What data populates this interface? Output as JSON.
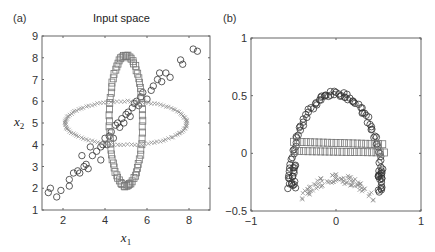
{
  "panels": {
    "a": {
      "label": "(a)",
      "title": "Input space"
    },
    "b": {
      "label": "(b)",
      "title": ""
    }
  },
  "chart_data": [
    {
      "type": "scatter",
      "panel": "(a)",
      "title": "Input space",
      "xlabel": "x1",
      "ylabel": "x2",
      "xlim": [
        1,
        9
      ],
      "ylim": [
        1,
        9
      ],
      "xticks": [
        2,
        4,
        6,
        8
      ],
      "yticks": [
        1,
        2,
        3,
        4,
        5,
        6,
        7,
        8,
        9
      ],
      "grid": false,
      "series": [
        {
          "name": "circles (diagonal line)",
          "marker": "o",
          "shape": "line",
          "description": "points scattered along line x2 ≈ x1 from (1.3,1.8) to (8.4,8.4)",
          "points": [
            [
              1.3,
              1.8
            ],
            [
              1.4,
              2.0
            ],
            [
              1.7,
              1.6
            ],
            [
              1.9,
              1.9
            ],
            [
              2.3,
              2.1
            ],
            [
              2.3,
              2.4
            ],
            [
              2.5,
              2.7
            ],
            [
              2.7,
              2.8
            ],
            [
              2.8,
              2.7
            ],
            [
              2.9,
              3.5
            ],
            [
              3.0,
              3.0
            ],
            [
              3.1,
              3.1
            ],
            [
              3.2,
              2.9
            ],
            [
              3.3,
              3.9
            ],
            [
              3.4,
              3.5
            ],
            [
              3.6,
              3.7
            ],
            [
              3.8,
              3.3
            ],
            [
              3.8,
              3.9
            ],
            [
              3.9,
              4.0
            ],
            [
              4.0,
              4.3
            ],
            [
              4.1,
              4.0
            ],
            [
              4.2,
              4.4
            ],
            [
              4.3,
              4.6
            ],
            [
              4.4,
              4.3
            ],
            [
              4.5,
              4.9
            ],
            [
              4.6,
              5.0
            ],
            [
              4.7,
              4.8
            ],
            [
              4.8,
              5.2
            ],
            [
              4.9,
              5.0
            ],
            [
              5.0,
              5.4
            ],
            [
              5.1,
              5.5
            ],
            [
              5.2,
              5.3
            ],
            [
              5.3,
              5.7
            ],
            [
              5.4,
              5.9
            ],
            [
              5.5,
              6.0
            ],
            [
              5.6,
              5.8
            ],
            [
              5.7,
              6.2
            ],
            [
              5.8,
              6.4
            ],
            [
              6.0,
              6.1
            ],
            [
              6.2,
              6.5
            ],
            [
              6.3,
              6.7
            ],
            [
              6.5,
              7.0
            ],
            [
              6.6,
              7.3
            ],
            [
              6.7,
              6.9
            ],
            [
              6.9,
              7.3
            ],
            [
              7.1,
              7.1
            ],
            [
              7.6,
              7.9
            ],
            [
              7.7,
              7.7
            ],
            [
              8.2,
              8.4
            ],
            [
              8.4,
              8.3
            ]
          ]
        },
        {
          "name": "squares (vertical ellipse)",
          "marker": "s",
          "shape": "ellipse",
          "center": [
            5.0,
            5.1
          ],
          "radii": [
            0.8,
            3.0
          ]
        },
        {
          "name": "crosses (horizontal ellipse)",
          "marker": "x",
          "shape": "ellipse",
          "center": [
            5.0,
            5.0
          ],
          "radii": [
            2.9,
            1.0
          ]
        }
      ]
    },
    {
      "type": "scatter",
      "panel": "(b)",
      "title": "",
      "xlabel": "",
      "ylabel": "",
      "xlim": [
        -1,
        1
      ],
      "ylim": [
        -0.5,
        1
      ],
      "xticks": [
        -1,
        0,
        1
      ],
      "yticks": [
        -0.5,
        0,
        0.5,
        1
      ],
      "grid": false,
      "series": [
        {
          "name": "circles (arch)",
          "marker": "o",
          "shape": "arch",
          "description": "upside-down U from (-0.55,-0.35) up to (0,0.52) down to (0.55,-0.35)"
        },
        {
          "name": "squares (band)",
          "marker": "s",
          "shape": "band",
          "description": "two rows of squares from x=-0.5 to 0.55, y≈0.1 and y≈0.0, slight downward slope"
        },
        {
          "name": "crosses (arc)",
          "marker": "x",
          "shape": "arc",
          "description": "inverted-U arc from (-0.4,-0.42) peak (0,-0.2) to (0.45,-0.35)"
        }
      ]
    }
  ]
}
